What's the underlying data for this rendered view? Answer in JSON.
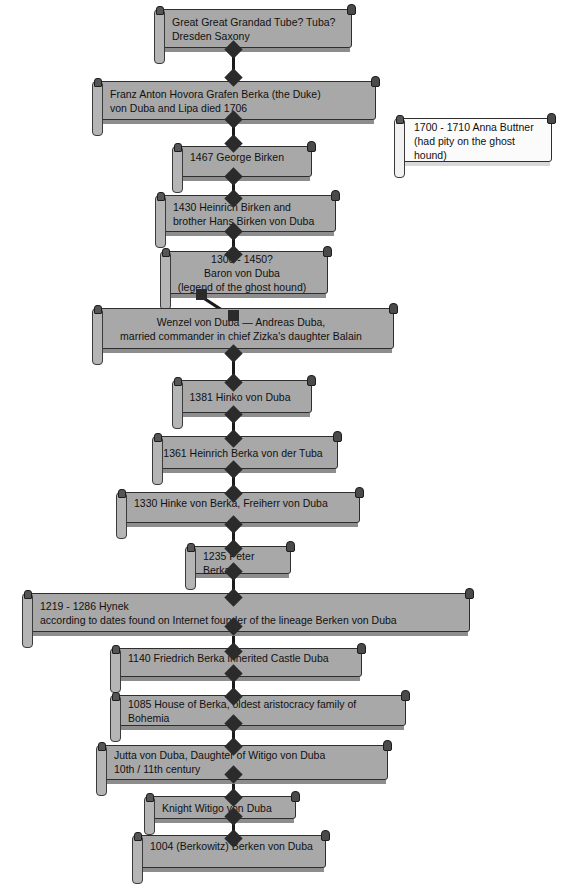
{
  "diagram": {
    "background_color": "#ffffff",
    "node_fill_color": "#a8a8a8",
    "node_alt_fill_color": "#fbfbfb",
    "node_border_color": "#2e2e2e",
    "connector_color": "#1a1a1a"
  },
  "nodes": [
    {
      "id": "great-great-grandad",
      "text": "Great Great Grandad Tube? Tuba?\nDresden Saxony",
      "align": "left",
      "style": "gray"
    },
    {
      "id": "franz-anton-hovora",
      "text": "Franz Anton Hovora Grafen Berka (the Duke)\n von Duba and Lipa died 1706",
      "align": "left",
      "style": "gray"
    },
    {
      "id": "anna-buttner",
      "text": "1700 - 1710 Anna Buttner\n(had pity on the ghost\nhound)",
      "align": "left",
      "style": "light"
    },
    {
      "id": "george-birken",
      "text": "1467 George Birken",
      "align": "left",
      "style": "gray"
    },
    {
      "id": "heinrich-birken",
      "text": "1430 Heinrich  Birken and\n brother Hans Birken von Duba",
      "align": "left",
      "style": "gray"
    },
    {
      "id": "baron-von-duba",
      "text": "1300 - 1450?\nBaron von Duba\n(legend  of the ghost hound)",
      "align": "center",
      "style": "gray"
    },
    {
      "id": "wenzel-von-duba",
      "text": "Wenzel von Duba — Andreas Duba,\nmarried commander in chief Zizka's daughter Balain",
      "align": "center",
      "style": "gray"
    },
    {
      "id": "hinko-von-duba",
      "text": "1381 Hinko von Duba",
      "align": "center",
      "style": "gray"
    },
    {
      "id": "heinrich-berka-von-der-tuba",
      "text": "1361 Heinrich  Berka von der Tuba",
      "align": "center",
      "style": "gray"
    },
    {
      "id": "hinke-von-berka",
      "text": "1330 Hinke von Berka, Freiherr von Duba",
      "align": "left",
      "style": "gray"
    },
    {
      "id": "peter-berka",
      "text": "1235  Peter Berka",
      "align": "left",
      "style": "gray"
    },
    {
      "id": "hynek",
      "text": "1219 - 1286 Hynek\naccording to dates found on Internet founder of the lineage Berken von Duba",
      "align": "left",
      "style": "gray"
    },
    {
      "id": "friedrich-berka",
      "text": "1140 Friedrich Berka     inherited Castle Duba",
      "align": "left",
      "style": "gray"
    },
    {
      "id": "house-of-berka",
      "text": "1085 House of Berka, oldest aristocracy family of Bohemia",
      "align": "left",
      "style": "gray"
    },
    {
      "id": "jutta-von-duba",
      "text": "Jutta von Duba, Daughter   of Witigo von Duba\n10th / 11th century",
      "align": "left",
      "style": "gray"
    },
    {
      "id": "knight-witigo",
      "text": "Knight Witigo      von Duba",
      "align": "left",
      "style": "gray"
    },
    {
      "id": "berken-von-duba-1004",
      "text": "1004 (Berkowitz)   Berken von Duba",
      "align": "left",
      "style": "gray"
    }
  ]
}
